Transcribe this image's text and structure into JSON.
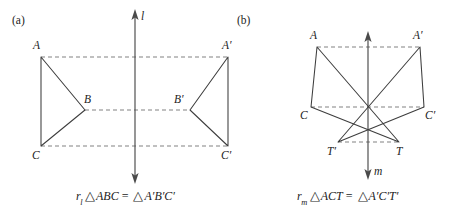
{
  "figure": {
    "panels": [
      {
        "key": "a",
        "label": "(a)",
        "axis": {
          "name": "l",
          "label": "l"
        },
        "vertices": [
          {
            "name": "A",
            "label": "A"
          },
          {
            "name": "B",
            "label": "B"
          },
          {
            "name": "C",
            "label": "C"
          },
          {
            "name": "Ap",
            "label": "A′"
          },
          {
            "name": "Bp",
            "label": "B′"
          },
          {
            "name": "Cp",
            "label": "C′"
          }
        ],
        "caption": {
          "operator": "r",
          "operator_sub": "l",
          "left_triangle": "ABC",
          "relation": "=",
          "right_triangle": "A′B′C′",
          "triangle_symbol": "△",
          "full_text": "r_l △ABC = △A′B′C′"
        }
      },
      {
        "key": "b",
        "label": "(b)",
        "axis": {
          "name": "m",
          "label": "m"
        },
        "vertices": [
          {
            "name": "A",
            "label": "A"
          },
          {
            "name": "C",
            "label": "C"
          },
          {
            "name": "T",
            "label": "T"
          },
          {
            "name": "Ap",
            "label": "A′"
          },
          {
            "name": "Cp",
            "label": "C′"
          },
          {
            "name": "Tp",
            "label": "T′"
          }
        ],
        "caption": {
          "operator": "r",
          "operator_sub": "m",
          "left_triangle": "ACT",
          "relation": "=",
          "right_triangle": "A′C′T′",
          "triangle_symbol": "△",
          "full_text": "r_m △ACT = △A′C′T′"
        }
      }
    ],
    "colors": {
      "background": "#ffffff",
      "stroke": "#3d3d3d",
      "dashed_stroke": "#7a7a7a",
      "axis": "#4a4a4a",
      "text": "#1c1c1c"
    }
  }
}
